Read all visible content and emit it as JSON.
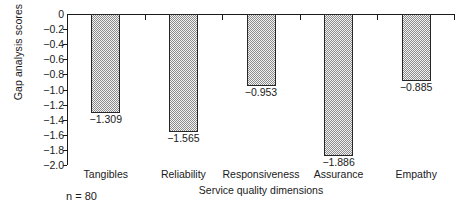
{
  "chart_data": {
    "type": "bar",
    "title": "",
    "subtitle": "",
    "xlabel": "Service quality dimensions",
    "ylabel": "Gap analysis scores",
    "categories": [
      "Tangibles",
      "Reliability",
      "Responsiveness",
      "Assurance",
      "Empathy"
    ],
    "values": [
      -1.309,
      -1.565,
      -0.953,
      -1.886,
      -0.885
    ],
    "value_labels": [
      "−1.309",
      "−1.565",
      "−0.953",
      "−1.886",
      "−0.885"
    ],
    "ylim": [
      -2.0,
      0.0
    ],
    "ytick_values": [
      0,
      -0.2,
      -0.4,
      -0.6,
      -0.8,
      -1.0,
      -1.2,
      -1.4,
      -1.6,
      -1.8,
      -2.0
    ],
    "ytick_labels": [
      "0",
      "−0.2",
      "−0.4",
      "−0.6",
      "−0.8",
      "−1.0",
      "−1.2",
      "−1.4",
      "−1.6",
      "−1.8",
      "−2.0"
    ],
    "grid": false,
    "legend": null,
    "legend_position": "none",
    "annotations": [
      "n = 80"
    ],
    "bar_fill": "#f2f2f2",
    "bar_pattern": "fine-checkerboard-dots",
    "bar_edge_color": "#262626",
    "axis_color": "#1a1a1a",
    "background": "#ffffff",
    "axis_position": "top",
    "bars_direction": "downward"
  },
  "annotation": {
    "sample_size": "n = 80"
  }
}
